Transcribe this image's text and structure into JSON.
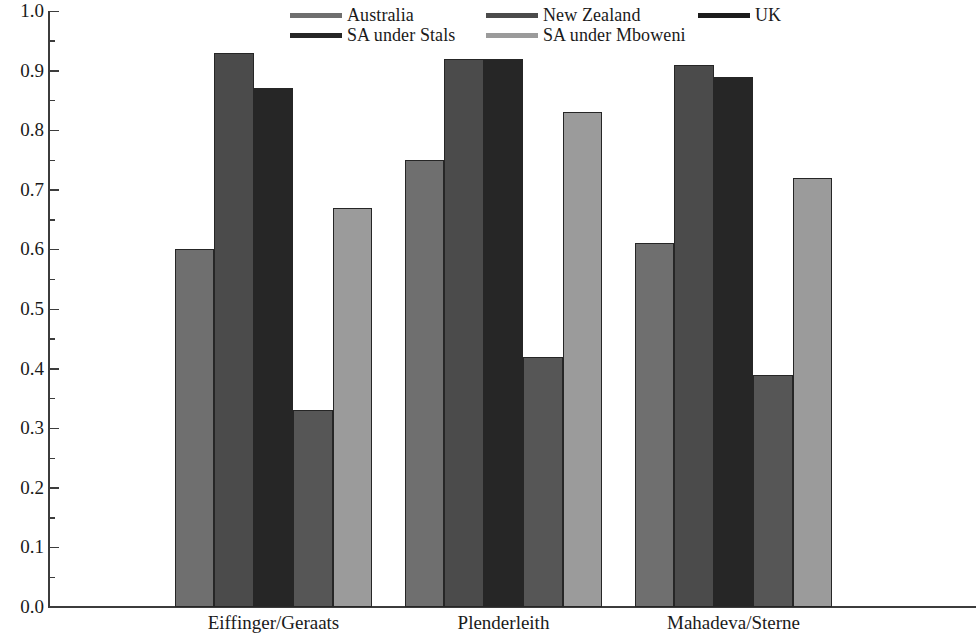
{
  "chart_data": {
    "type": "bar",
    "title": "",
    "subtitle": "",
    "xlabel": "",
    "ylabel": "",
    "ylim": [
      0.0,
      1.0
    ],
    "ytick_labels": [
      "0.0",
      "0.1",
      "0.2",
      "0.3",
      "0.4",
      "0.5",
      "0.6",
      "0.7",
      "0.8",
      "0.9",
      "1.0"
    ],
    "ytick_values": [
      0.0,
      0.1,
      0.2,
      0.3,
      0.4,
      0.5,
      0.6,
      0.7,
      0.8,
      0.9,
      1.0
    ],
    "minor_tick_interval": 0.05,
    "grid": false,
    "legend_position": "top-center",
    "categories": [
      "Eiffinger/Geraats",
      "Plenderleith",
      "Mahadeva/Sterne"
    ],
    "series": [
      {
        "name": "Australia",
        "color": "#6f6f6f",
        "values": [
          0.6,
          0.75,
          0.61
        ]
      },
      {
        "name": "New Zealand",
        "color": "#4b4b4b",
        "values": [
          0.93,
          0.92,
          0.91
        ]
      },
      {
        "name": "UK",
        "color": "#262626",
        "values": [
          0.87,
          0.92,
          0.89
        ]
      },
      {
        "name": "SA under Stals",
        "color": "#565656",
        "values": [
          0.33,
          0.42,
          0.39
        ]
      },
      {
        "name": "SA under Mboweni",
        "color": "#9b9b9b",
        "values": [
          0.67,
          0.83,
          0.72
        ]
      }
    ]
  },
  "legend": {
    "entries": [
      {
        "label": "Australia",
        "swatch_color": "#6f6f6f"
      },
      {
        "label": "New Zealand",
        "swatch_color": "#4b4b4b"
      },
      {
        "label": "UK",
        "swatch_color": "#1c1c1c"
      },
      {
        "label": "SA under Stals",
        "swatch_color": "#262626"
      },
      {
        "label": "SA under Mboweni",
        "swatch_color": "#9b9b9b"
      }
    ]
  },
  "axis": {
    "y_min_label": "0.0",
    "y_max_label": "1.0"
  }
}
